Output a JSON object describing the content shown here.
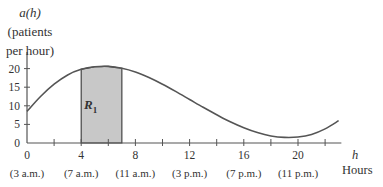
{
  "chart_data": {
    "type": "line",
    "title": "",
    "ylabel_lines": [
      "a(h)",
      "(patients",
      "per hour)"
    ],
    "xlabel_var": "h",
    "xlabel": "Hours",
    "x_ticks": [
      0,
      4,
      8,
      12,
      16,
      20
    ],
    "x_minor_ticks": [
      2,
      6,
      10,
      14,
      18,
      22
    ],
    "x_time_labels": [
      "(3 a.m.)",
      "(7 a.m.)",
      "(11 a.m.)",
      "(3 p.m.)",
      "(7 p.m.)",
      "(11 p.m.)"
    ],
    "y_ticks": [
      0,
      5,
      10,
      15,
      20
    ],
    "xlim": [
      0,
      23
    ],
    "ylim": [
      0,
      22
    ],
    "grid": false,
    "series": [
      {
        "name": "a(h)",
        "x": [
          0,
          1,
          2,
          3,
          4,
          5,
          6,
          7,
          8,
          9,
          10,
          11,
          12,
          13,
          14,
          15,
          16,
          17,
          18,
          19,
          20,
          21,
          22,
          23
        ],
        "values": [
          8.5,
          12.5,
          15.8,
          18.3,
          19.8,
          20.5,
          20.6,
          20.1,
          19.1,
          17.6,
          15.8,
          13.8,
          11.7,
          9.6,
          7.6,
          5.7,
          4.1,
          2.8,
          1.9,
          1.5,
          1.6,
          2.3,
          3.8,
          6.0
        ]
      }
    ],
    "shaded_region": {
      "label": "R",
      "subscript": "1",
      "x_from": 4,
      "x_to": 7,
      "color": "#c8c8c8"
    },
    "annotations": [
      "R1"
    ]
  },
  "labels": {
    "y_title_1": "a(h)",
    "y_title_2": "(patients",
    "y_title_3": "per hour)",
    "x_var": "h",
    "x_name": "Hours",
    "region": "R",
    "region_sub": "1"
  }
}
